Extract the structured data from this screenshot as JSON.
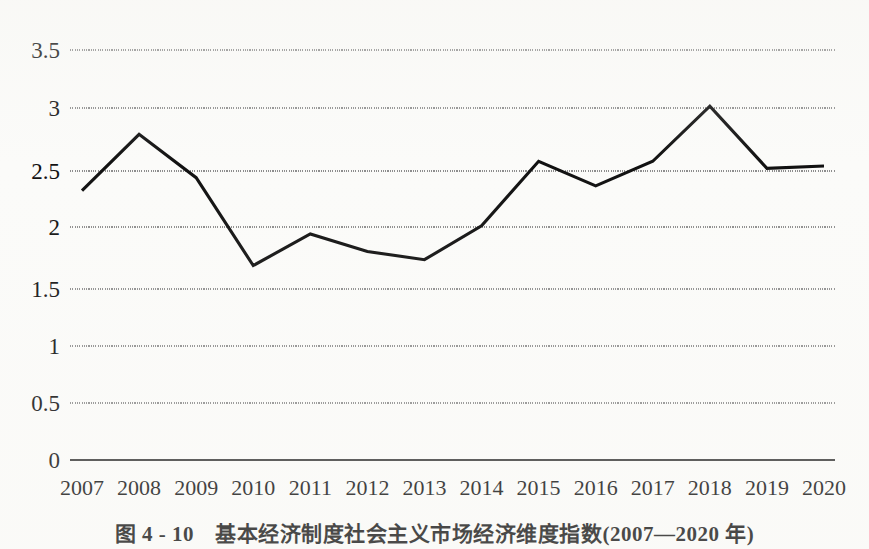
{
  "chart_data": {
    "type": "line",
    "title": "",
    "xlabel": "",
    "ylabel": "",
    "categories": [
      "2007",
      "2008",
      "2009",
      "2010",
      "2011",
      "2012",
      "2013",
      "2014",
      "2015",
      "2016",
      "2017",
      "2018",
      "2019",
      "2020"
    ],
    "values": [
      2.3,
      2.78,
      2.41,
      1.66,
      1.93,
      1.78,
      1.71,
      2.0,
      2.55,
      2.34,
      2.55,
      3.02,
      2.49,
      2.51
    ],
    "series": [
      {
        "name": "基本经济制度社会主义市场经济维度指数",
        "values": [
          2.3,
          2.78,
          2.41,
          1.66,
          1.93,
          1.78,
          1.71,
          2.0,
          2.55,
          2.34,
          2.55,
          3.02,
          2.49,
          2.51
        ]
      }
    ],
    "ylim": [
      0,
      3.5
    ],
    "yticks": [
      0,
      0.5,
      1,
      1.5,
      2,
      2.5,
      3,
      3.5
    ],
    "ytick_labels": [
      "0",
      "0.5",
      "1",
      "1.5",
      "2",
      "2.5",
      "3",
      "3.5"
    ],
    "grid": true,
    "grid_axis": "y",
    "legend": false,
    "legend_position": "none",
    "line_color": "#111111",
    "grid_color": "#8d8d8d",
    "background_color": "#fbfbf9"
  },
  "caption": {
    "full_text": "图 4 - 10　基本经济制度社会主义市场经济维度指数(2007—2020 年)",
    "figure_number": "图 4 - 10",
    "figure_title": "基本经济制度社会主义市场经济维度指数",
    "period": "(2007—2020 年)"
  }
}
